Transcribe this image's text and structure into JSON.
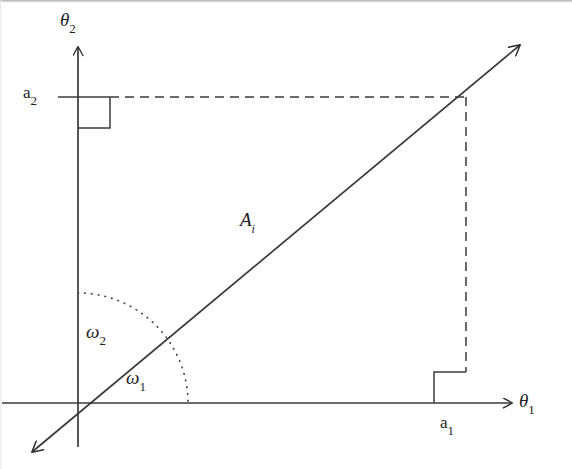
{
  "figure": {
    "type": "vector-angle-diagram",
    "background_color": "#ffffff",
    "line_color": "#333333",
    "text_color": "#1d1d1d"
  },
  "axes": {
    "horizontal": {
      "name": "theta-1-axis",
      "label_base": "θ",
      "label_sub": "1",
      "arrow": "right"
    },
    "vertical": {
      "name": "theta-2-axis",
      "label_base": "θ",
      "label_sub": "2",
      "arrow": "up"
    },
    "origin_px": [
      78,
      403
    ]
  },
  "vector": {
    "name": "loading-vector",
    "label_base": "A",
    "label_sub": "i",
    "start_px": [
      32,
      452
    ],
    "end_px": [
      520,
      45
    ],
    "arrow_both_ends": true
  },
  "coordinates": {
    "a1": {
      "label_base": "a",
      "label_sub": "1",
      "position_px": [
        466,
        403
      ],
      "right_angle_marker": true
    },
    "a2": {
      "label_base": "a",
      "label_sub": "2",
      "position_px": [
        78,
        97
      ],
      "right_angle_marker": true
    }
  },
  "angles": {
    "omega1": {
      "label_base": "ω",
      "label_sub": "1",
      "description": "angle between vector and theta-1 axis"
    },
    "omega2": {
      "label_base": "ω",
      "label_sub": "2",
      "description": "angle between vector and theta-2 axis"
    },
    "arc_radius_px": 110,
    "arc_style": "dotted"
  },
  "guides": {
    "horizontal_dashed": {
      "from_px": [
        110,
        97
      ],
      "to_px": [
        466,
        97
      ]
    },
    "vertical_dashed": {
      "from_px": [
        466,
        97
      ],
      "to_px": [
        466,
        372
      ]
    }
  }
}
